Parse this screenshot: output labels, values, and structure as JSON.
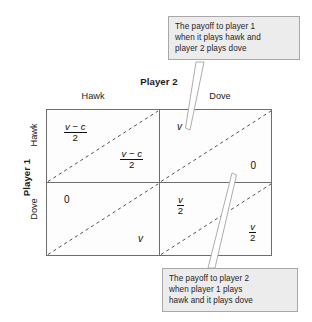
{
  "figure": {
    "type": "payoff-matrix",
    "title_row": "Player 1",
    "title_col": "Player 2"
  },
  "axes": {
    "column_player_label": "Player 2",
    "row_player_label": "Player 1",
    "column_headers": [
      "Hawk",
      "Dove"
    ],
    "row_headers": [
      "Hawk",
      "Dove"
    ]
  },
  "cells": {
    "hawk_hawk": {
      "player1": {
        "numerator": "v − c",
        "denominator": "2"
      },
      "player2": {
        "numerator": "v − c",
        "denominator": "2"
      }
    },
    "hawk_dove": {
      "player1": {
        "value": "v"
      },
      "player2": {
        "value": "0"
      }
    },
    "dove_hawk": {
      "player1": {
        "value": "0"
      },
      "player2": {
        "value": "v"
      }
    },
    "dove_dove": {
      "player1": {
        "numerator": "v",
        "denominator": "2"
      },
      "player2": {
        "numerator": "v",
        "denominator": "2"
      }
    }
  },
  "callouts": {
    "top": {
      "line1": "The payoff to player 1",
      "line2": "when it plays hawk and",
      "line3": "player 2 plays dove"
    },
    "bottom": {
      "line1": "The payoff to player 2",
      "line2": "when player 1 plays",
      "line3": "hawk and it plays dove"
    }
  },
  "colors": {
    "matrix_border": "#6d6d6d",
    "diagonal": "#525252",
    "callout_fill": "#ececec",
    "callout_border": "#a8a8a8",
    "text": "#1a1a1a"
  }
}
